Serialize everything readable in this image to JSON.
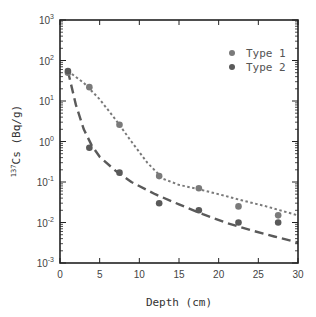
{
  "chart_data": {
    "type": "scatter",
    "title": "",
    "xlabel": "Depth (cm)",
    "ylabel": "137Cs (Bq/g)",
    "ylabel_parts": {
      "sup": "137",
      "main": "Cs (Bq/g)"
    },
    "xlim": [
      0,
      30
    ],
    "ylim": [
      0.001,
      1000
    ],
    "yscale": "log",
    "grid": false,
    "legend_position": "upper right",
    "x_ticks": [
      0,
      5,
      10,
      15,
      20,
      25,
      30
    ],
    "y_ticks": [
      {
        "exp": "3",
        "value": 1000
      },
      {
        "exp": "2",
        "value": 100
      },
      {
        "exp": "1",
        "value": 10
      },
      {
        "exp": "0",
        "value": 1
      },
      {
        "exp": "-1",
        "value": 0.1
      },
      {
        "exp": "-2",
        "value": 0.01
      },
      {
        "exp": "-3",
        "value": 0.001
      }
    ],
    "series": [
      {
        "name": "Type 1",
        "marker": "circle",
        "color": "#7a7a7a",
        "x": [
          1.0,
          3.7,
          7.5,
          12.5,
          17.5,
          22.5,
          27.5
        ],
        "y": [
          50,
          22,
          2.6,
          0.14,
          0.07,
          0.025,
          0.015
        ],
        "fit_line": {
          "style": "dotted",
          "x": [
            1,
            3,
            5,
            7,
            9,
            11,
            13,
            15,
            17,
            20,
            23,
            26,
            30
          ],
          "y": [
            55,
            28,
            11,
            3.5,
            1.0,
            0.3,
            0.12,
            0.085,
            0.07,
            0.05,
            0.035,
            0.025,
            0.015
          ]
        }
      },
      {
        "name": "Type 2",
        "marker": "circle",
        "color": "#5a5a5a",
        "x": [
          1.0,
          3.7,
          7.5,
          12.5,
          17.5,
          22.5,
          27.5
        ],
        "y": [
          55,
          0.7,
          0.17,
          0.03,
          0.02,
          0.01,
          0.01
        ],
        "fit_line": {
          "style": "dashed",
          "x": [
            1,
            2,
            3,
            4,
            5,
            7,
            9,
            12,
            15,
            18,
            21,
            24,
            27,
            30
          ],
          "y": [
            55,
            8,
            2.0,
            0.8,
            0.42,
            0.19,
            0.1,
            0.05,
            0.028,
            0.016,
            0.0098,
            0.0065,
            0.0045,
            0.0032
          ]
        }
      }
    ]
  }
}
